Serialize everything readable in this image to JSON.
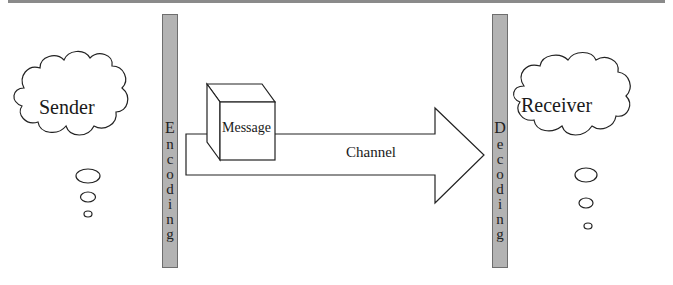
{
  "diagram": {
    "title": "",
    "sender": {
      "label": "Sender"
    },
    "receiver": {
      "label": "Receiver"
    },
    "encoding": {
      "label": "Encoding",
      "letters": [
        "E",
        "n",
        "c",
        "o",
        "d",
        "i",
        "n",
        "g"
      ]
    },
    "decoding": {
      "label": "Decoding",
      "letters": [
        "D",
        "e",
        "c",
        "o",
        "d",
        "i",
        "n",
        "g"
      ]
    },
    "message": {
      "label": "Message"
    },
    "channel": {
      "label": "Channel"
    },
    "colors": {
      "bar_fill": "#b3b3b3",
      "bar_border": "#6e6e6e",
      "stroke": "#222222",
      "top_rule": "#8a8a8a"
    }
  }
}
